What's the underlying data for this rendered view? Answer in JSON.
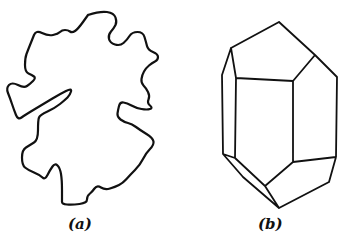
{
  "figure": {
    "panels": [
      {
        "id": "a",
        "label": "(a)",
        "description": "Irregular grain outline",
        "outline_points": [
          [
            88,
            15
          ],
          [
            100,
            11
          ],
          [
            114,
            13
          ],
          [
            117,
            22
          ],
          [
            114,
            28
          ],
          [
            108,
            35
          ],
          [
            110,
            43
          ],
          [
            120,
            46
          ],
          [
            127,
            40
          ],
          [
            132,
            32
          ],
          [
            143,
            32
          ],
          [
            146,
            42
          ],
          [
            148,
            50
          ],
          [
            158,
            54
          ],
          [
            158,
            60
          ],
          [
            152,
            63
          ],
          [
            146,
            68
          ],
          [
            142,
            75
          ],
          [
            141,
            83
          ],
          [
            146,
            88
          ],
          [
            150,
            96
          ],
          [
            147,
            103
          ],
          [
            153,
            108
          ],
          [
            147,
            110
          ],
          [
            136,
            108
          ],
          [
            127,
            103
          ],
          [
            120,
            102
          ],
          [
            118,
            110
          ],
          [
            117,
            117
          ],
          [
            124,
            122
          ],
          [
            132,
            124
          ],
          [
            140,
            130
          ],
          [
            153,
            138
          ],
          [
            154,
            145
          ],
          [
            146,
            153
          ],
          [
            140,
            165
          ],
          [
            130,
            175
          ],
          [
            123,
            183
          ],
          [
            115,
            187
          ],
          [
            105,
            190
          ],
          [
            97,
            185
          ],
          [
            92,
            192
          ],
          [
            87,
            196
          ],
          [
            87,
            203
          ],
          [
            72,
            205
          ],
          [
            62,
            204
          ],
          [
            62,
            200
          ],
          [
            62,
            180
          ],
          [
            60,
            168
          ],
          [
            55,
            163
          ],
          [
            50,
            170
          ],
          [
            45,
            180
          ],
          [
            40,
            175
          ],
          [
            28,
            170
          ],
          [
            22,
            165
          ],
          [
            22,
            150
          ],
          [
            30,
            145
          ],
          [
            38,
            140
          ],
          [
            38,
            120
          ],
          [
            40,
            115
          ],
          [
            55,
            108
          ],
          [
            65,
            100
          ],
          [
            70,
            95
          ],
          [
            72,
            88
          ],
          [
            60,
            94
          ],
          [
            45,
            103
          ],
          [
            25,
            115
          ],
          [
            18,
            120
          ],
          [
            14,
            110
          ],
          [
            10,
            98
          ],
          [
            6,
            88
          ],
          [
            12,
            82
          ],
          [
            24,
            88
          ],
          [
            30,
            84
          ],
          [
            36,
            78
          ],
          [
            32,
            75
          ],
          [
            25,
            72
          ],
          [
            25,
            58
          ],
          [
            28,
            50
          ],
          [
            32,
            40
          ],
          [
            36,
            30
          ],
          [
            48,
            36
          ],
          [
            58,
            34
          ],
          [
            62,
            30
          ],
          [
            68,
            30
          ],
          [
            72,
            33
          ],
          [
            78,
            29
          ],
          [
            88,
            15
          ]
        ],
        "inner_notch": [
          [
            72,
            88
          ],
          [
            65,
            92
          ],
          [
            55,
            98
          ],
          [
            44,
            105
          ],
          [
            38,
            110
          ],
          [
            42,
            112
          ],
          [
            50,
            108
          ],
          [
            60,
            103
          ],
          [
            68,
            98
          ]
        ]
      },
      {
        "id": "b",
        "label": "(b)",
        "description": "Idealized crystal (hexagonal prism with pyramidal terminations)",
        "vertices": {
          "top_apex": [
            279,
            22
          ],
          "upper_left": [
            231,
            48
          ],
          "left_top": [
            222,
            75
          ],
          "inner_left_top": [
            236,
            78
          ],
          "inner_right_top": [
            293,
            81
          ],
          "upper_right": [
            315,
            55
          ],
          "right_top": [
            337,
            77
          ],
          "left_bottom": [
            223,
            154
          ],
          "inner_left_bottom": [
            235,
            158
          ],
          "inner_right_bottom": [
            293,
            162
          ],
          "right_bottom": [
            336,
            157
          ],
          "right_lower": [
            329,
            182
          ],
          "lower_inner": [
            265,
            186
          ],
          "left_lower": [
            243,
            177
          ],
          "bottom_apex": [
            279,
            208
          ]
        }
      }
    ]
  },
  "labels": {
    "a": "(a)",
    "b": "(b)"
  },
  "colors": {
    "stroke": "#111111",
    "background": "#ffffff"
  }
}
